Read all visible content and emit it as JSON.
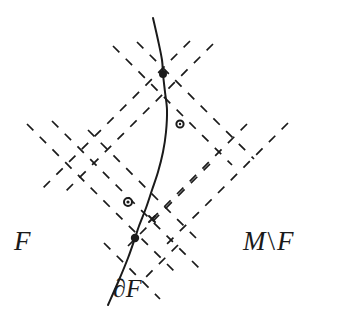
{
  "figure": {
    "type": "mathematical-diagram",
    "width": 342,
    "height": 321,
    "background_color": "#ffffff",
    "stroke_color": "#1a1a1a"
  },
  "labels": {
    "region_inside": "F",
    "region_outside_M": "M",
    "region_outside_sep": "\\",
    "region_outside_F": "F",
    "boundary": "∂F"
  },
  "chart_data": {
    "type": "diagram",
    "title": "",
    "curve": {
      "name": "boundary-curve",
      "label": "∂F",
      "stroke_width": 2.0,
      "dash": "solid",
      "points": [
        [
          153,
          18
        ],
        [
          158,
          40
        ],
        [
          162,
          60
        ],
        [
          163,
          74
        ],
        [
          165,
          92
        ],
        [
          167,
          110
        ],
        [
          166,
          132
        ],
        [
          163,
          152
        ],
        [
          158,
          172
        ],
        [
          152,
          190
        ],
        [
          146,
          208
        ],
        [
          139,
          226
        ],
        [
          135,
          238
        ],
        [
          128,
          258
        ],
        [
          119,
          280
        ],
        [
          108,
          305
        ]
      ]
    },
    "grid": {
      "name": "dashed-lattice",
      "dash_pattern": "9 9",
      "stroke_width": 1.7,
      "angles_deg": [
        45,
        -45
      ],
      "lines": [
        {
          "id": "d1",
          "dir": "down-right",
          "x1": 27,
          "y1": 124,
          "x2": 178,
          "y2": 275
        },
        {
          "id": "d2",
          "dir": "down-right",
          "x1": 52,
          "y1": 121,
          "x2": 203,
          "y2": 272
        },
        {
          "id": "d3",
          "dir": "down-right",
          "x1": 113,
          "y1": 46,
          "x2": 232,
          "y2": 165
        },
        {
          "id": "d4",
          "dir": "down-right",
          "x1": 137,
          "y1": 42,
          "x2": 254,
          "y2": 159
        },
        {
          "id": "d5",
          "dir": "down-right",
          "x1": 88,
          "y1": 130,
          "x2": 196,
          "y2": 238
        },
        {
          "id": "d6",
          "dir": "down-right",
          "x1": 104,
          "y1": 243,
          "x2": 160,
          "y2": 299
        },
        {
          "id": "e1",
          "dir": "down-left",
          "x1": 213,
          "y1": 44,
          "x2": 62,
          "y2": 195
        },
        {
          "id": "e2",
          "dir": "down-left",
          "x1": 190,
          "y1": 41,
          "x2": 40,
          "y2": 191
        },
        {
          "id": "e3",
          "dir": "down-left",
          "x1": 247,
          "y1": 124,
          "x2": 150,
          "y2": 221
        },
        {
          "id": "e4",
          "dir": "down-left",
          "x1": 288,
          "y1": 123,
          "x2": 167,
          "y2": 244
        },
        {
          "id": "e5",
          "dir": "down-left",
          "x1": 210,
          "y1": 164,
          "x2": 128,
          "y2": 246
        },
        {
          "id": "e6",
          "dir": "down-left",
          "x1": 178,
          "y1": 245,
          "x2": 140,
          "y2": 283
        }
      ]
    },
    "vertices": [
      {
        "id": "v-top",
        "name": "vertex-on-curve-top",
        "x": 163,
        "y": 74,
        "marker": "filled-dot",
        "radius": 4.0,
        "on_curve": true
      },
      {
        "id": "v-left",
        "name": "vertex-off-curve-left",
        "x": 128,
        "y": 202,
        "marker": "open-circle",
        "radius": 4.0,
        "on_curve": false
      },
      {
        "id": "v-bottom",
        "name": "vertex-on-curve-bottom",
        "x": 135,
        "y": 238,
        "marker": "filled-dot",
        "radius": 4.2,
        "on_curve": true
      },
      {
        "id": "v-right",
        "name": "point-marker-right",
        "x": 180,
        "y": 124,
        "marker": "open-circle",
        "radius": 3.6,
        "on_curve": false
      },
      {
        "id": "v-small",
        "name": "crossing-mark-small",
        "x": 152,
        "y": 219,
        "marker": "small-cross",
        "radius": 3.0,
        "on_curve": false
      }
    ],
    "regions": [
      {
        "name": "F",
        "label": "F",
        "side": "left",
        "label_x": 22,
        "label_y": 247
      },
      {
        "name": "M\\F",
        "label": "M \\ F",
        "side": "right",
        "label_x": 270,
        "label_y": 247
      }
    ],
    "annotations": [
      {
        "text": "∂F",
        "x": 128,
        "y": 292,
        "target": "boundary-curve"
      }
    ],
    "xlabel": "",
    "ylabel": "",
    "grid_on": true,
    "legend": "none"
  }
}
